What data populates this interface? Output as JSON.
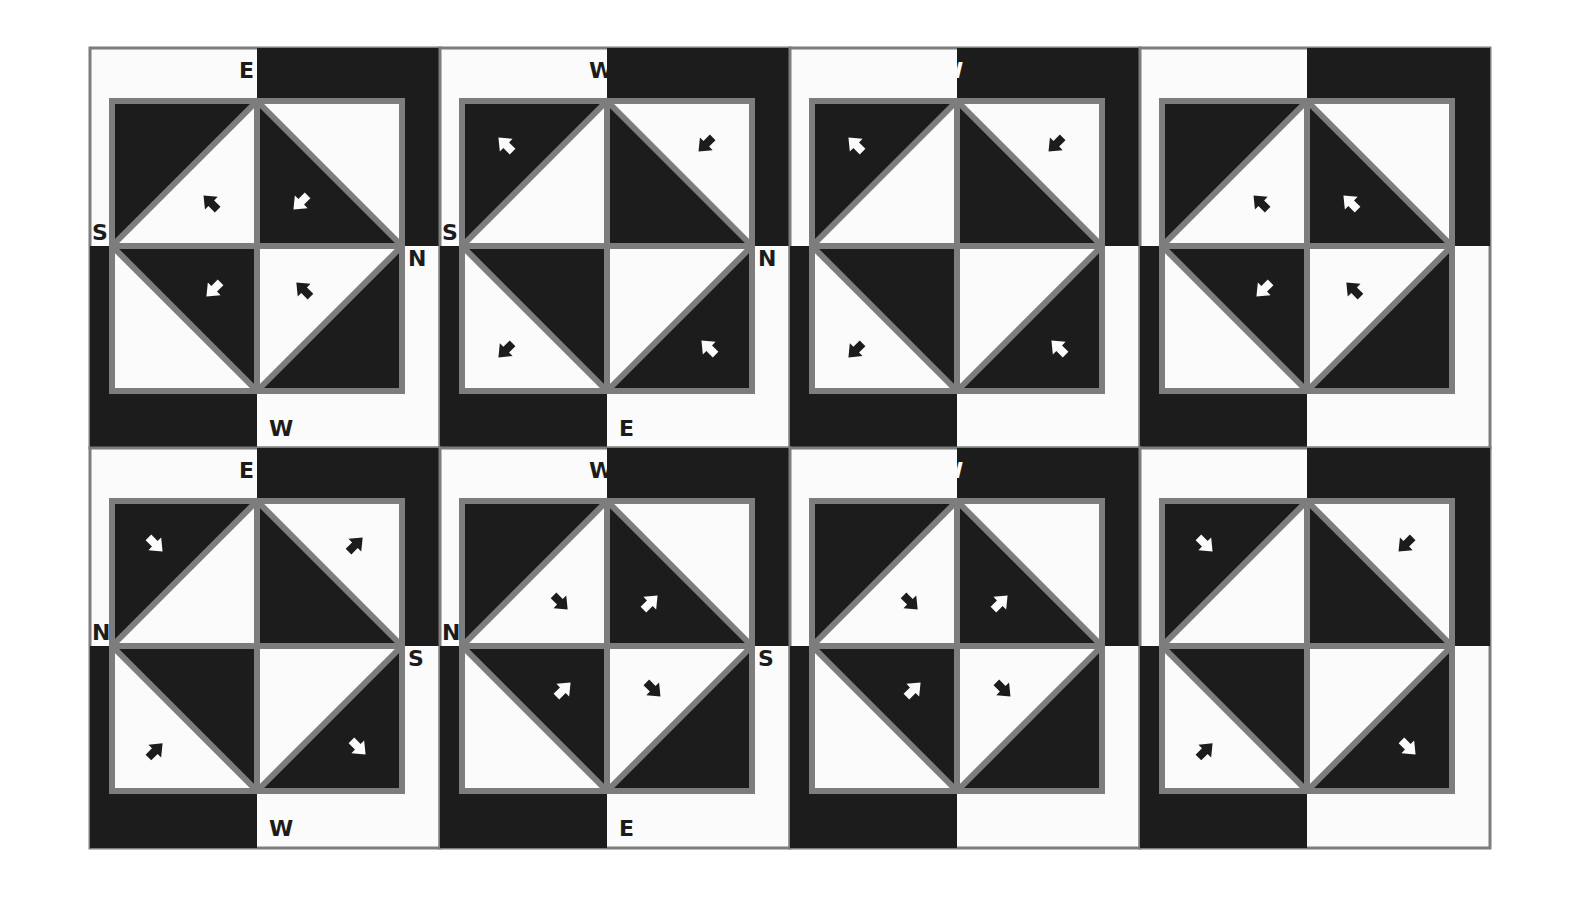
{
  "artwork": {
    "description": "Painted grid of eight pinwheel tiles with compass letters and arrows",
    "colors": {
      "dark": "#1c1c1c",
      "light": "#fbfbfb",
      "border": "#7d7d7d",
      "paper": "#ffffff"
    },
    "rows": 2,
    "cols": 4
  },
  "tiles": [
    {
      "row": 0,
      "col": 0,
      "labels": {
        "top": "E",
        "left": "S",
        "right": "N",
        "bottom": "W"
      },
      "label_colors": {
        "top": "dark",
        "left": "dark",
        "right": "dark",
        "bottom": "dark"
      },
      "band": "top-right+bottom-left",
      "quads": [
        {
          "dark": "top-left",
          "arrow": "nw",
          "arrow_color": "dark"
        },
        {
          "dark": "bottom-left",
          "arrow": "sw",
          "arrow_color": "light"
        },
        {
          "dark": "top-right",
          "arrow": "sw",
          "arrow_color": "light"
        },
        {
          "dark": "bottom-right",
          "arrow": "nw",
          "arrow_color": "dark"
        }
      ]
    },
    {
      "row": 0,
      "col": 1,
      "labels": {
        "top": "W",
        "left": "S",
        "right": "N",
        "bottom": "E"
      },
      "label_colors": {
        "top": "dark",
        "left": "dark",
        "right": "dark",
        "bottom": "dark"
      },
      "band": "top-right+bottom-left",
      "quads": [
        {
          "dark": "top-left",
          "arrow": "nw",
          "arrow_color": "light"
        },
        {
          "dark": "bottom-left",
          "arrow": "sw",
          "arrow_color": "dark"
        },
        {
          "dark": "top-right",
          "arrow": "sw",
          "arrow_color": "dark"
        },
        {
          "dark": "bottom-right",
          "arrow": "nw",
          "arrow_color": "light"
        }
      ]
    },
    {
      "row": 0,
      "col": 2,
      "labels": {
        "top": "W",
        "left": "S",
        "right": "N",
        "bottom": "E"
      },
      "label_colors": {
        "top": "light",
        "left": "light",
        "right": "light",
        "bottom": "light"
      },
      "band": "top-right+bottom-left",
      "quads": [
        {
          "dark": "top-left",
          "arrow": "nw",
          "arrow_color": "light"
        },
        {
          "dark": "bottom-left",
          "arrow": "sw",
          "arrow_color": "dark"
        },
        {
          "dark": "top-right",
          "arrow": "sw",
          "arrow_color": "dark"
        },
        {
          "dark": "bottom-right",
          "arrow": "nw",
          "arrow_color": "light"
        }
      ]
    },
    {
      "row": 0,
      "col": 3,
      "labels": {
        "top": "E",
        "left": "S",
        "right": "N",
        "bottom": "W"
      },
      "label_colors": {
        "top": "light",
        "left": "light",
        "right": "light",
        "bottom": "light"
      },
      "band": "top-right+bottom-left",
      "quads": [
        {
          "dark": "top-left",
          "arrow": "nw",
          "arrow_color": "dark"
        },
        {
          "dark": "bottom-left",
          "arrow": "sw",
          "arrow_color": "light"
        },
        {
          "dark": "top-right",
          "arrow": "nw",
          "arrow_color": "light"
        },
        {
          "dark": "bottom-right",
          "arrow": "nw",
          "arrow_color": "dark"
        }
      ]
    },
    {
      "row": 1,
      "col": 0,
      "labels": {
        "top": "E",
        "left": "N",
        "right": "S",
        "bottom": "W"
      },
      "label_colors": {
        "top": "dark",
        "left": "dark",
        "right": "dark",
        "bottom": "dark"
      },
      "band": "top-right+bottom-left",
      "quads": [
        {
          "dark": "top-left",
          "arrow": "se",
          "arrow_color": "light"
        },
        {
          "dark": "bottom-left",
          "arrow": "ne",
          "arrow_color": "dark"
        },
        {
          "dark": "top-right",
          "arrow": "ne",
          "arrow_color": "dark"
        },
        {
          "dark": "bottom-right",
          "arrow": "se",
          "arrow_color": "light"
        }
      ]
    },
    {
      "row": 1,
      "col": 1,
      "labels": {
        "top": "W",
        "left": "N",
        "right": "S",
        "bottom": "E"
      },
      "label_colors": {
        "top": "dark",
        "left": "dark",
        "right": "dark",
        "bottom": "dark"
      },
      "band": "top-right+bottom-left",
      "quads": [
        {
          "dark": "top-left",
          "arrow": "se",
          "arrow_color": "dark"
        },
        {
          "dark": "bottom-left",
          "arrow": "ne",
          "arrow_color": "light"
        },
        {
          "dark": "top-right",
          "arrow": "ne",
          "arrow_color": "light"
        },
        {
          "dark": "bottom-right",
          "arrow": "se",
          "arrow_color": "dark"
        }
      ]
    },
    {
      "row": 1,
      "col": 2,
      "labels": {
        "top": "W",
        "left": "N",
        "right": "S",
        "bottom": "E"
      },
      "label_colors": {
        "top": "light",
        "left": "light",
        "right": "light",
        "bottom": "light"
      },
      "band": "top-right+bottom-left",
      "quads": [
        {
          "dark": "top-left",
          "arrow": "se",
          "arrow_color": "dark"
        },
        {
          "dark": "bottom-left",
          "arrow": "ne",
          "arrow_color": "light"
        },
        {
          "dark": "top-right",
          "arrow": "ne",
          "arrow_color": "light"
        },
        {
          "dark": "bottom-right",
          "arrow": "se",
          "arrow_color": "dark"
        }
      ]
    },
    {
      "row": 1,
      "col": 3,
      "labels": {
        "top": "E",
        "left": "N",
        "right": "S",
        "bottom": "W"
      },
      "label_colors": {
        "top": "light",
        "left": "light",
        "right": "light",
        "bottom": "light"
      },
      "band": "top-right+bottom-left",
      "quads": [
        {
          "dark": "top-left",
          "arrow": "se",
          "arrow_color": "light"
        },
        {
          "dark": "bottom-left",
          "arrow": "ne",
          "arrow_color": "dark"
        },
        {
          "dark": "top-right",
          "arrow": "sw",
          "arrow_color": "dark"
        },
        {
          "dark": "bottom-right",
          "arrow": "se",
          "arrow_color": "light"
        }
      ]
    }
  ]
}
